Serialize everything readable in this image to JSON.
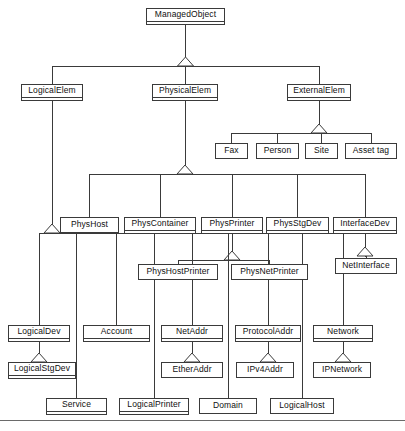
{
  "diagram": {
    "type": "uml-generalization-tree",
    "stroke_color": "#3a3a3a",
    "background_color": "#ffffff",
    "footer_rule_color": "#6a6a6a",
    "nodes": [
      {
        "id": "managedobject",
        "label": "ManagedObject",
        "x": 146,
        "y": 8,
        "w": 79,
        "h": 17,
        "compartment": true
      },
      {
        "id": "logicalelem",
        "label": "LogicalElem",
        "x": 21,
        "y": 84,
        "w": 62,
        "h": 17,
        "compartment": true
      },
      {
        "id": "physicalelem",
        "label": "PhysicalElem",
        "x": 152,
        "y": 84,
        "w": 66,
        "h": 17,
        "compartment": true
      },
      {
        "id": "externalelem",
        "label": "ExternalElem",
        "x": 287,
        "y": 84,
        "w": 64,
        "h": 17,
        "compartment": true
      },
      {
        "id": "fax",
        "label": "Fax",
        "x": 215,
        "y": 143,
        "w": 33,
        "h": 16,
        "compartment": false
      },
      {
        "id": "person",
        "label": "Person",
        "x": 256,
        "y": 143,
        "w": 43,
        "h": 16,
        "compartment": false
      },
      {
        "id": "site",
        "label": "Site",
        "x": 305,
        "y": 143,
        "w": 33,
        "h": 16,
        "compartment": false
      },
      {
        "id": "assettag",
        "label": "Asset tag",
        "x": 345,
        "y": 143,
        "w": 52,
        "h": 16,
        "compartment": false
      },
      {
        "id": "physhost",
        "label": "PhysHost",
        "x": 60,
        "y": 217,
        "w": 59,
        "h": 16,
        "compartment": false
      },
      {
        "id": "physcontainer",
        "label": "PhysContainer",
        "x": 124,
        "y": 217,
        "w": 72,
        "h": 17,
        "compartment": true
      },
      {
        "id": "physprinter",
        "label": "PhysPrinter",
        "x": 201,
        "y": 217,
        "w": 62,
        "h": 17,
        "compartment": true
      },
      {
        "id": "physstgdev",
        "label": "PhysStgDev",
        "x": 266,
        "y": 217,
        "w": 63,
        "h": 17,
        "compartment": true
      },
      {
        "id": "interfacedev",
        "label": "InterfaceDev",
        "x": 333,
        "y": 217,
        "w": 64,
        "h": 17,
        "compartment": true
      },
      {
        "id": "physhostprinter",
        "label": "PhysHostPrinter",
        "x": 138,
        "y": 264,
        "w": 80,
        "h": 16,
        "compartment": false
      },
      {
        "id": "physnetprinter",
        "label": "PhysNetPrinter",
        "x": 231,
        "y": 264,
        "w": 77,
        "h": 16,
        "compartment": false
      },
      {
        "id": "netinterface",
        "label": "NetInterface",
        "x": 335,
        "y": 258,
        "w": 62,
        "h": 16,
        "compartment": false
      },
      {
        "id": "logicaldev",
        "label": "LogicalDev",
        "x": 8,
        "y": 325,
        "w": 62,
        "h": 17,
        "compartment": true
      },
      {
        "id": "account",
        "label": "Account",
        "x": 83,
        "y": 325,
        "w": 67,
        "h": 17,
        "compartment": true
      },
      {
        "id": "netaddr",
        "label": "NetAddr",
        "x": 161,
        "y": 325,
        "w": 62,
        "h": 17,
        "compartment": true
      },
      {
        "id": "protocoladdr",
        "label": "ProtocolAddr",
        "x": 235,
        "y": 325,
        "w": 66,
        "h": 17,
        "compartment": true
      },
      {
        "id": "network",
        "label": "Network",
        "x": 313,
        "y": 325,
        "w": 60,
        "h": 17,
        "compartment": true
      },
      {
        "id": "logicalstgdev",
        "label": "LogicalStgDev",
        "x": 8,
        "y": 362,
        "w": 68,
        "h": 17,
        "compartment": true
      },
      {
        "id": "etheraddr",
        "label": "EtherAddr",
        "x": 161,
        "y": 362,
        "w": 62,
        "h": 16,
        "compartment": false
      },
      {
        "id": "ipv4addr",
        "label": "IPv4Addr",
        "x": 236,
        "y": 362,
        "w": 58,
        "h": 16,
        "compartment": false
      },
      {
        "id": "ipnetwork",
        "label": "IPNetwork",
        "x": 313,
        "y": 362,
        "w": 58,
        "h": 16,
        "compartment": false
      },
      {
        "id": "service",
        "label": "Service",
        "x": 46,
        "y": 398,
        "w": 61,
        "h": 17,
        "compartment": true
      },
      {
        "id": "logicalprinter",
        "label": "LogicalPrinter",
        "x": 119,
        "y": 398,
        "w": 70,
        "h": 17,
        "compartment": true
      },
      {
        "id": "domain",
        "label": "Domain",
        "x": 199,
        "y": 398,
        "w": 58,
        "h": 16,
        "compartment": false
      },
      {
        "id": "logicalhost",
        "label": "LogicalHost",
        "x": 270,
        "y": 398,
        "w": 64,
        "h": 16,
        "compartment": false
      }
    ],
    "generalizations": [
      {
        "parent": "managedobject",
        "children": [
          "logicalelem",
          "physicalelem",
          "externalelem"
        ]
      },
      {
        "parent": "externalelem",
        "children": [
          "fax",
          "person",
          "site",
          "assettag"
        ]
      },
      {
        "parent": "physicalelem",
        "children": [
          "physhost",
          "physcontainer",
          "physprinter",
          "physstgdev",
          "interfacedev"
        ]
      },
      {
        "parent": "physprinter",
        "children": [
          "physhostprinter",
          "physnetprinter"
        ]
      },
      {
        "parent": "interfacedev",
        "children": [
          "netinterface"
        ]
      },
      {
        "parent": "logicalelem",
        "children": [
          "logicaldev",
          "account",
          "netaddr",
          "protocoladdr",
          "network",
          "service",
          "logicalprinter",
          "domain",
          "logicalhost"
        ]
      },
      {
        "parent": "logicaldev",
        "children": [
          "logicalstgdev"
        ]
      },
      {
        "parent": "netaddr",
        "children": [
          "etheraddr"
        ]
      },
      {
        "parent": "protocoladdr",
        "children": [
          "ipv4addr"
        ]
      },
      {
        "parent": "network",
        "children": [
          "ipnetwork"
        ]
      }
    ],
    "footer_rule": {
      "y": 420
    }
  }
}
